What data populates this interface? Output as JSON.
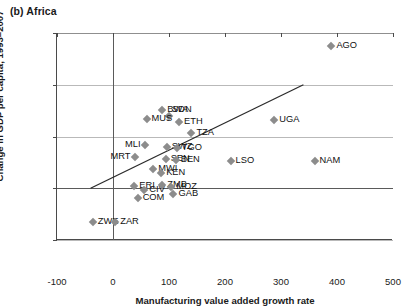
{
  "panel": {
    "tag": "(b)",
    "title": "Africa"
  },
  "axes": {
    "xlabel": "Manufacturing value added growth rate",
    "ylabel": "Change in GDP per capita, 1993–2007",
    "xticks": [
      "-100",
      "0",
      "100",
      "200",
      "300",
      "400",
      "500"
    ],
    "yticks": [
      "1.5",
      "1",
      "0.5",
      "0",
      "-0.5"
    ]
  },
  "chart_data": {
    "type": "scatter",
    "title": "(b) Africa",
    "xlabel": "Manufacturing value added growth rate",
    "ylabel": "Change in GDP per capita, 1993–2007",
    "xlim": [
      -100,
      500
    ],
    "ylim": [
      -0.5,
      1.5
    ],
    "xticks": [
      -100,
      0,
      100,
      200,
      300,
      400,
      500
    ],
    "yticks": [
      -0.5,
      0,
      0.5,
      1,
      1.5
    ],
    "grid": "horizontal",
    "legend": "none",
    "marker_color": "#8c8c8c",
    "marker_shape": "diamond",
    "trendline": {
      "x0": -40,
      "y0": 0.0,
      "x1": 340,
      "y1": 1.0
    },
    "points": [
      {
        "label": "AGO",
        "x": 390,
        "y": 1.37,
        "lp": "r"
      },
      {
        "label": "BWA",
        "x": 88,
        "y": 0.76,
        "lp": "r"
      },
      {
        "label": "SDN",
        "x": 100,
        "y": 0.7,
        "lp": "tr"
      },
      {
        "label": "MUS",
        "x": 60,
        "y": 0.67,
        "lp": "r"
      },
      {
        "label": "ETH",
        "x": 118,
        "y": 0.64,
        "lp": "r"
      },
      {
        "label": "UGA",
        "x": 288,
        "y": 0.66,
        "lp": "r"
      },
      {
        "label": "TZA",
        "x": 140,
        "y": 0.53,
        "lp": "r"
      },
      {
        "label": "MLI",
        "x": 58,
        "y": 0.42,
        "lp": "l"
      },
      {
        "label": "SWZ",
        "x": 96,
        "y": 0.4,
        "lp": "r"
      },
      {
        "label": "TGO",
        "x": 114,
        "y": 0.39,
        "lp": "r"
      },
      {
        "label": "LSO",
        "x": 210,
        "y": 0.26,
        "lp": "r"
      },
      {
        "label": "NAM",
        "x": 360,
        "y": 0.26,
        "lp": "r"
      },
      {
        "label": "MRT",
        "x": 40,
        "y": 0.3,
        "lp": "l"
      },
      {
        "label": "SEN",
        "x": 94,
        "y": 0.28,
        "lp": "r"
      },
      {
        "label": "BEN",
        "x": 112,
        "y": 0.27,
        "lp": "r"
      },
      {
        "label": "MWI",
        "x": 72,
        "y": 0.19,
        "lp": "r"
      },
      {
        "label": "KEN",
        "x": 86,
        "y": 0.15,
        "lp": "r"
      },
      {
        "label": "ERI",
        "x": 38,
        "y": 0.02,
        "lp": "r"
      },
      {
        "label": "CIV",
        "x": 56,
        "y": -0.02,
        "lp": "r"
      },
      {
        "label": "ZMB",
        "x": 88,
        "y": 0.03,
        "lp": "r"
      },
      {
        "label": "MOZ",
        "x": 104,
        "y": 0.01,
        "lp": "r"
      },
      {
        "label": "GAB",
        "x": 108,
        "y": -0.06,
        "lp": "r"
      },
      {
        "label": "COM",
        "x": 44,
        "y": -0.09,
        "lp": "r"
      },
      {
        "label": "ZWE",
        "x": -36,
        "y": -0.33,
        "lp": "r"
      },
      {
        "label": "ZAR",
        "x": 4,
        "y": -0.33,
        "lp": "r"
      }
    ]
  }
}
